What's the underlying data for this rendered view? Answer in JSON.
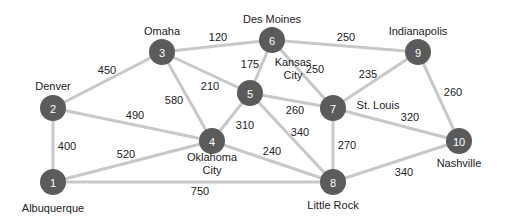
{
  "diagram": {
    "type": "weighted-undirected-graph",
    "colors": {
      "node": "#5b5b5b",
      "edge": "#c8c8c8",
      "text": "#222222",
      "node_text": "#ffffff"
    },
    "nodes": [
      {
        "id": "1",
        "label": "Albuquerque",
        "x": 53,
        "y": 182,
        "lx": 53,
        "ly": 208,
        "lines": [
          "Albuquerque"
        ]
      },
      {
        "id": "2",
        "label": "Denver",
        "x": 53,
        "y": 108,
        "lx": 53,
        "ly": 86,
        "lines": [
          "Denver"
        ]
      },
      {
        "id": "3",
        "label": "Omaha",
        "x": 162,
        "y": 52,
        "lx": 162,
        "ly": 31,
        "lines": [
          "Omaha"
        ]
      },
      {
        "id": "4",
        "label": "Oklahoma City",
        "x": 212,
        "y": 141,
        "lx": 212,
        "ly": 163,
        "lines": [
          "Oklahoma",
          "City"
        ]
      },
      {
        "id": "5",
        "label": "Kansas City",
        "x": 250,
        "y": 93,
        "lx": 293,
        "ly": 68,
        "lines": [
          "Kansas",
          "City"
        ]
      },
      {
        "id": "6",
        "label": "Des Moines",
        "x": 272,
        "y": 40,
        "lx": 272,
        "ly": 19,
        "lines": [
          "Des Moines"
        ]
      },
      {
        "id": "7",
        "label": "St. Louis",
        "x": 333,
        "y": 108,
        "lx": 378,
        "ly": 105,
        "lines": [
          "St. Louis"
        ]
      },
      {
        "id": "8",
        "label": "Little Rock",
        "x": 333,
        "y": 182,
        "lx": 333,
        "ly": 205,
        "lines": [
          "Little Rock"
        ]
      },
      {
        "id": "9",
        "label": "Indianapolis",
        "x": 418,
        "y": 52,
        "lx": 418,
        "ly": 31,
        "lines": [
          "Indianapolis"
        ]
      },
      {
        "id": "10",
        "label": "Nashville",
        "x": 459,
        "y": 141,
        "lx": 459,
        "ly": 163,
        "lines": [
          "Nashville"
        ]
      }
    ],
    "edges": [
      {
        "from": "1",
        "to": "2",
        "weight": "400",
        "wx": 67,
        "wy": 146
      },
      {
        "from": "1",
        "to": "4",
        "weight": "520",
        "wx": 126,
        "wy": 154
      },
      {
        "from": "1",
        "to": "8",
        "weight": "750",
        "wx": 200,
        "wy": 191
      },
      {
        "from": "2",
        "to": "3",
        "weight": "450",
        "wx": 107,
        "wy": 70
      },
      {
        "from": "2",
        "to": "4",
        "weight": "490",
        "wx": 135,
        "wy": 115
      },
      {
        "from": "3",
        "to": "4",
        "weight": "580",
        "wx": 174,
        "wy": 100
      },
      {
        "from": "3",
        "to": "5",
        "weight": "210",
        "wx": 210,
        "wy": 86
      },
      {
        "from": "3",
        "to": "6",
        "weight": "120",
        "wx": 218,
        "wy": 37
      },
      {
        "from": "4",
        "to": "5",
        "weight": "310",
        "wx": 245,
        "wy": 125
      },
      {
        "from": "4",
        "to": "8",
        "weight": "240",
        "wx": 272,
        "wy": 151
      },
      {
        "from": "5",
        "to": "6",
        "weight": "175",
        "wx": 250,
        "wy": 64
      },
      {
        "from": "5",
        "to": "7",
        "weight": "260",
        "wx": 295,
        "wy": 110
      },
      {
        "from": "5",
        "to": "8",
        "weight": "340",
        "wx": 300,
        "wy": 132
      },
      {
        "from": "6",
        "to": "7",
        "weight": "250",
        "wx": 315,
        "wy": 69
      },
      {
        "from": "6",
        "to": "9",
        "weight": "250",
        "wx": 346,
        "wy": 37
      },
      {
        "from": "7",
        "to": "8",
        "weight": "270",
        "wx": 347,
        "wy": 145
      },
      {
        "from": "7",
        "to": "9",
        "weight": "235",
        "wx": 368,
        "wy": 74
      },
      {
        "from": "7",
        "to": "10",
        "weight": "320",
        "wx": 410,
        "wy": 117
      },
      {
        "from": "8",
        "to": "10",
        "weight": "340",
        "wx": 404,
        "wy": 172
      },
      {
        "from": "9",
        "to": "10",
        "weight": "260",
        "wx": 453,
        "wy": 92
      }
    ]
  }
}
